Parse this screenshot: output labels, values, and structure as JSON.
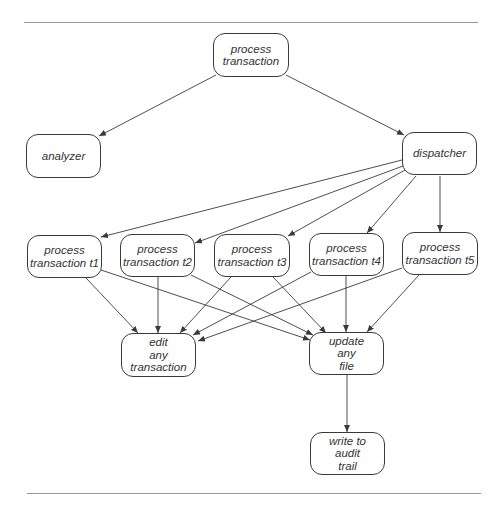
{
  "diagram": {
    "type": "call-hierarchy",
    "nodes": [
      {
        "id": "process_transaction",
        "lines": [
          "process",
          "transaction"
        ],
        "x": 213,
        "y": 33,
        "w": 76,
        "h": 44
      },
      {
        "id": "analyzer",
        "lines": [
          "analyzer"
        ],
        "x": 26,
        "y": 134,
        "w": 75,
        "h": 44
      },
      {
        "id": "dispatcher",
        "lines": [
          "dispatcher"
        ],
        "x": 402,
        "y": 132,
        "w": 75,
        "h": 43
      },
      {
        "id": "process_t1",
        "lines": [
          "process",
          "transaction t1"
        ],
        "x": 27,
        "y": 235,
        "w": 75,
        "h": 43
      },
      {
        "id": "process_t2",
        "lines": [
          "process",
          "transaction t2"
        ],
        "x": 120,
        "y": 234,
        "w": 75,
        "h": 43
      },
      {
        "id": "process_t3",
        "lines": [
          "process",
          "transaction t3"
        ],
        "x": 214,
        "y": 234,
        "w": 76,
        "h": 43
      },
      {
        "id": "process_t4",
        "lines": [
          "process",
          "transaction t4"
        ],
        "x": 309,
        "y": 233,
        "w": 75,
        "h": 43
      },
      {
        "id": "process_t5",
        "lines": [
          "process",
          "transaction t5"
        ],
        "x": 402,
        "y": 232,
        "w": 76,
        "h": 43
      },
      {
        "id": "edit_any_transaction",
        "lines": [
          "edit",
          "any",
          "transaction"
        ],
        "x": 121,
        "y": 333,
        "w": 75,
        "h": 44
      },
      {
        "id": "update_any_file",
        "lines": [
          "update",
          "any",
          "file"
        ],
        "x": 309,
        "y": 332,
        "w": 75,
        "h": 43
      },
      {
        "id": "write_audit_trail",
        "lines": [
          "write to",
          "audit",
          "trail"
        ],
        "x": 310,
        "y": 432,
        "w": 75,
        "h": 43
      }
    ],
    "edges": [
      {
        "from": "process_transaction",
        "to": "analyzer",
        "x1": 216,
        "y1": 75,
        "x2": 99,
        "y2": 136
      },
      {
        "from": "process_transaction",
        "to": "dispatcher",
        "x1": 286,
        "y1": 75,
        "x2": 404,
        "y2": 135
      },
      {
        "from": "dispatcher",
        "to": "process_t1",
        "x1": 402,
        "y1": 160,
        "x2": 101,
        "y2": 237
      },
      {
        "from": "dispatcher",
        "to": "process_t2",
        "x1": 403,
        "y1": 166,
        "x2": 195,
        "y2": 243
      },
      {
        "from": "dispatcher",
        "to": "process_t3",
        "x1": 405,
        "y1": 170,
        "x2": 288,
        "y2": 236
      },
      {
        "from": "dispatcher",
        "to": "process_t4",
        "x1": 416,
        "y1": 176,
        "x2": 367,
        "y2": 233
      },
      {
        "from": "dispatcher",
        "to": "process_t5",
        "x1": 440,
        "y1": 176,
        "x2": 440,
        "y2": 232
      },
      {
        "from": "process_t1",
        "to": "edit_any_transaction",
        "x1": 86,
        "y1": 278,
        "x2": 138,
        "y2": 333
      },
      {
        "from": "process_t1",
        "to": "update_any_file",
        "x1": 101,
        "y1": 270,
        "x2": 310,
        "y2": 340
      },
      {
        "from": "process_t2",
        "to": "edit_any_transaction",
        "x1": 158,
        "y1": 277,
        "x2": 158,
        "y2": 333
      },
      {
        "from": "process_t2",
        "to": "update_any_file",
        "x1": 191,
        "y1": 275,
        "x2": 313,
        "y2": 335
      },
      {
        "from": "process_t3",
        "to": "edit_any_transaction",
        "x1": 231,
        "y1": 277,
        "x2": 180,
        "y2": 333
      },
      {
        "from": "process_t3",
        "to": "update_any_file",
        "x1": 273,
        "y1": 277,
        "x2": 326,
        "y2": 333
      },
      {
        "from": "process_t4",
        "to": "edit_any_transaction",
        "x1": 311,
        "y1": 272,
        "x2": 193,
        "y2": 335
      },
      {
        "from": "process_t4",
        "to": "update_any_file",
        "x1": 346,
        "y1": 276,
        "x2": 346,
        "y2": 332
      },
      {
        "from": "process_t5",
        "to": "edit_any_transaction",
        "x1": 402,
        "y1": 268,
        "x2": 198,
        "y2": 341
      },
      {
        "from": "process_t5",
        "to": "update_any_file",
        "x1": 419,
        "y1": 275,
        "x2": 367,
        "y2": 332
      },
      {
        "from": "update_any_file",
        "to": "write_audit_trail",
        "x1": 347,
        "y1": 375,
        "x2": 347,
        "y2": 432
      }
    ],
    "rules": [
      {
        "x": 24,
        "y": 22,
        "w": 454
      },
      {
        "x": 27,
        "y": 493,
        "w": 454
      }
    ],
    "colors": {
      "line": "#3a3a3a",
      "text": "#333333",
      "rule": "#9a9a9a",
      "background": "#ffffff"
    }
  }
}
